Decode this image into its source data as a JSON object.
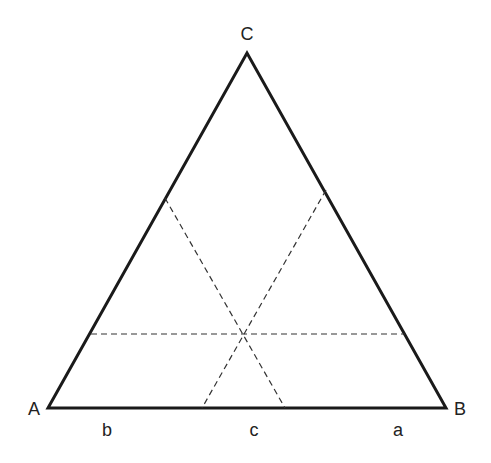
{
  "diagram": {
    "type": "ternary-triangle",
    "vertices": {
      "A": {
        "label": "A",
        "x": 48,
        "y": 408
      },
      "B": {
        "label": "B",
        "x": 446,
        "y": 408
      },
      "C": {
        "label": "C",
        "x": 247,
        "y": 53
      }
    },
    "base_labels": {
      "b": "b",
      "c": "c",
      "a": "a"
    },
    "dashed_lines": [
      {
        "name": "horizontal",
        "x1": 91,
        "y1": 334,
        "x2": 405,
        "y2": 334
      },
      {
        "name": "left-to-base",
        "x1": 165,
        "y1": 198,
        "x2": 285,
        "y2": 408
      },
      {
        "name": "right-to-base",
        "x1": 326,
        "y1": 190,
        "x2": 202,
        "y2": 408
      }
    ],
    "colors": {
      "stroke": "#1a1a1a",
      "dashed": "#333333",
      "text": "#222222"
    }
  }
}
